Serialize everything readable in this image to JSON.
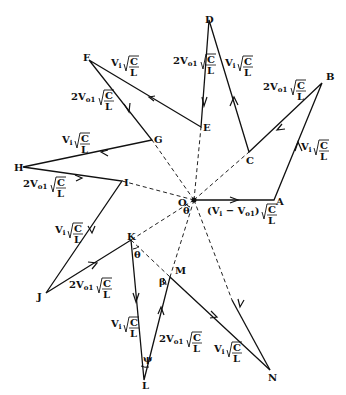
{
  "diagram": {
    "type": "phasor-state-plane-trajectory",
    "origin": {
      "label": "O",
      "x": 194,
      "y": 200
    },
    "points": {
      "A": {
        "x": 274,
        "y": 200
      },
      "B": {
        "x": 322,
        "y": 83
      },
      "C": {
        "x": 249,
        "y": 152
      },
      "D": {
        "x": 209,
        "y": 20
      },
      "E": {
        "x": 201,
        "y": 127
      },
      "F": {
        "x": 89,
        "y": 60
      },
      "G": {
        "x": 152,
        "y": 140
      },
      "H": {
        "x": 23,
        "y": 167
      },
      "I": {
        "x": 122,
        "y": 181
      },
      "J": {
        "x": 46,
        "y": 293
      },
      "K": {
        "x": 131,
        "y": 240
      },
      "L": {
        "x": 144,
        "y": 380
      },
      "M": {
        "x": 170,
        "y": 277
      },
      "N": {
        "x": 270,
        "y": 370
      }
    },
    "segments": [
      {
        "from": "O",
        "to": "A",
        "label": "(Vi − Vo1) √(C/L)"
      },
      {
        "from": "A",
        "to": "B",
        "label": "Vi √(C/L)"
      },
      {
        "from": "B",
        "to": "C",
        "label": "2Vo1 √(C/L)"
      },
      {
        "from": "C",
        "to": "D",
        "label": "Vi √(C/L)"
      },
      {
        "from": "D",
        "to": "E",
        "label": "2Vo1 √(C/L)"
      },
      {
        "from": "E",
        "to": "F",
        "label": "Vi √(C/L)"
      },
      {
        "from": "F",
        "to": "G",
        "label": "2Vo1 √(C/L)"
      },
      {
        "from": "G",
        "to": "H",
        "label": "Vi √(C/L)"
      },
      {
        "from": "H",
        "to": "I",
        "label": "2Vo1 √(C/L)"
      },
      {
        "from": "I",
        "to": "J",
        "label": "Vi √(C/L)"
      },
      {
        "from": "J",
        "to": "K",
        "label": "2Vo1 √(C/L)"
      },
      {
        "from": "K",
        "to": "L",
        "label": "Vi √(C/L)"
      },
      {
        "from": "L",
        "to": "M",
        "label": "2Vo1 √(C/L)"
      },
      {
        "from": "M",
        "to": "N",
        "label": "Vi √(C/L)"
      },
      {
        "from": "O",
        "to": "N",
        "label": ""
      }
    ],
    "dashed_radii": [
      "C",
      "E",
      "G",
      "I",
      "K",
      "M"
    ],
    "angles": {
      "theta_at_O": "θ",
      "theta_at_K": "θ",
      "beta_at_M": "β",
      "psi_at_L": "ψ"
    },
    "point_labels": [
      "O",
      "A",
      "B",
      "C",
      "D",
      "E",
      "F",
      "G",
      "H",
      "I",
      "J",
      "K",
      "L",
      "M",
      "N"
    ],
    "expr": {
      "vi": "V",
      "vi_sub": "i",
      "vo": "2V",
      "vo_sub": "o1",
      "frac_num": "C",
      "frac_den": "L",
      "oa_open": "(V",
      "oa_mid": " − V",
      "oa_close": ")"
    }
  }
}
